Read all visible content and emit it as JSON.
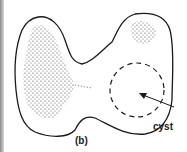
{
  "figure": {
    "panel_label": "(b)",
    "annotations": [
      {
        "text": "cyst",
        "points_to": "dashed-circle-region"
      }
    ]
  }
}
